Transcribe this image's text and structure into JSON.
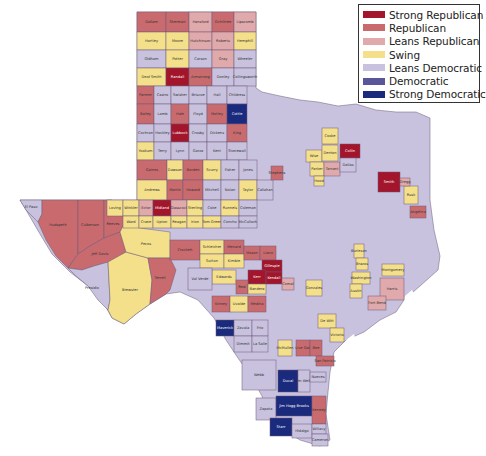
{
  "legend": {
    "items": [
      {
        "label": "Strong Republican",
        "color": "#a3152b"
      },
      {
        "label": "Republican",
        "color": "#c96b6e"
      },
      {
        "label": "Leans Republican",
        "color": "#e0a9ab"
      },
      {
        "label": "Swing",
        "color": "#f4e08a"
      },
      {
        "label": "Leans Democratic",
        "color": "#c8c2de"
      },
      {
        "label": "Democratic",
        "color": "#5a569a"
      },
      {
        "label": "Strong Democratic",
        "color": "#1a2a7c"
      }
    ]
  },
  "colors": {
    "SR": "#a3152b",
    "R": "#c96b6e",
    "LR": "#e0a9ab",
    "S": "#f4e08a",
    "LD": "#c8c2de",
    "D": "#5a569a",
    "SD": "#1a2a7c",
    "base": "#c8c2de"
  },
  "counties": [
    {
      "name": "Dallam",
      "c": "R",
      "x": 137,
      "y": 12,
      "w": 29,
      "h": 20
    },
    {
      "name": "Sherman",
      "c": "R",
      "x": 166,
      "y": 12,
      "w": 23,
      "h": 20
    },
    {
      "name": "Hansford",
      "c": "LR",
      "x": 189,
      "y": 12,
      "w": 23,
      "h": 20
    },
    {
      "name": "Ochiltree",
      "c": "R",
      "x": 212,
      "y": 12,
      "w": 22,
      "h": 20
    },
    {
      "name": "Lipscomb",
      "c": "LR",
      "x": 234,
      "y": 12,
      "w": 22,
      "h": 20
    },
    {
      "name": "Hartley",
      "c": "S",
      "x": 137,
      "y": 32,
      "w": 29,
      "h": 18
    },
    {
      "name": "Moore",
      "c": "S",
      "x": 166,
      "y": 32,
      "w": 23,
      "h": 18
    },
    {
      "name": "Hutchinson",
      "c": "LR",
      "x": 189,
      "y": 32,
      "w": 23,
      "h": 18
    },
    {
      "name": "Roberts",
      "c": "LR",
      "x": 212,
      "y": 32,
      "w": 22,
      "h": 18
    },
    {
      "name": "Hemphill",
      "c": "S",
      "x": 234,
      "y": 32,
      "w": 22,
      "h": 18
    },
    {
      "name": "Oldham",
      "c": "LD",
      "x": 137,
      "y": 50,
      "w": 29,
      "h": 18
    },
    {
      "name": "Potter",
      "c": "S",
      "x": 166,
      "y": 50,
      "w": 23,
      "h": 18
    },
    {
      "name": "Carson",
      "c": "LD",
      "x": 189,
      "y": 50,
      "w": 23,
      "h": 18
    },
    {
      "name": "Gray",
      "c": "LR",
      "x": 212,
      "y": 50,
      "w": 22,
      "h": 18
    },
    {
      "name": "Wheeler",
      "c": "LD",
      "x": 234,
      "y": 50,
      "w": 22,
      "h": 18
    },
    {
      "name": "Deaf Smith",
      "c": "S",
      "x": 137,
      "y": 68,
      "w": 29,
      "h": 18
    },
    {
      "name": "Randall",
      "c": "SR",
      "x": 166,
      "y": 68,
      "w": 23,
      "h": 18
    },
    {
      "name": "Armstrong",
      "c": "R",
      "x": 189,
      "y": 68,
      "w": 23,
      "h": 18
    },
    {
      "name": "Donley",
      "c": "LD",
      "x": 212,
      "y": 68,
      "w": 22,
      "h": 18
    },
    {
      "name": "Collingsworth",
      "c": "LD",
      "x": 234,
      "y": 68,
      "w": 22,
      "h": 18
    },
    {
      "name": "Parmer",
      "c": "R",
      "x": 137,
      "y": 86,
      "w": 17,
      "h": 18
    },
    {
      "name": "Castro",
      "c": "LD",
      "x": 154,
      "y": 86,
      "w": 17,
      "h": 18
    },
    {
      "name": "Swisher",
      "c": "LD",
      "x": 171,
      "y": 86,
      "w": 18,
      "h": 18
    },
    {
      "name": "Briscoe",
      "c": "LD",
      "x": 189,
      "y": 86,
      "w": 18,
      "h": 18
    },
    {
      "name": "Hall",
      "c": "LD",
      "x": 207,
      "y": 86,
      "w": 20,
      "h": 18
    },
    {
      "name": "Childress",
      "c": "LD",
      "x": 227,
      "y": 86,
      "w": 20,
      "h": 18
    },
    {
      "name": "Bailey",
      "c": "R",
      "x": 137,
      "y": 104,
      "w": 17,
      "h": 20
    },
    {
      "name": "Lamb",
      "c": "LD",
      "x": 154,
      "y": 104,
      "w": 17,
      "h": 20
    },
    {
      "name": "Hale",
      "c": "R",
      "x": 171,
      "y": 104,
      "w": 18,
      "h": 20
    },
    {
      "name": "Floyd",
      "c": "LD",
      "x": 189,
      "y": 104,
      "w": 18,
      "h": 20
    },
    {
      "name": "Motley",
      "c": "R",
      "x": 207,
      "y": 104,
      "w": 20,
      "h": 20
    },
    {
      "name": "Cottle",
      "c": "SD",
      "x": 227,
      "y": 104,
      "w": 20,
      "h": 20
    },
    {
      "name": "Cochran",
      "c": "LD",
      "x": 137,
      "y": 124,
      "w": 17,
      "h": 18
    },
    {
      "name": "Hockley",
      "c": "LD",
      "x": 154,
      "y": 124,
      "w": 17,
      "h": 18
    },
    {
      "name": "Lubbock",
      "c": "SR",
      "x": 171,
      "y": 124,
      "w": 18,
      "h": 18
    },
    {
      "name": "Crosby",
      "c": "LD",
      "x": 189,
      "y": 124,
      "w": 18,
      "h": 18
    },
    {
      "name": "Dickens",
      "c": "LD",
      "x": 207,
      "y": 124,
      "w": 20,
      "h": 18
    },
    {
      "name": "King",
      "c": "R",
      "x": 227,
      "y": 124,
      "w": 20,
      "h": 18
    },
    {
      "name": "Yoakum",
      "c": "S",
      "x": 137,
      "y": 142,
      "w": 17,
      "h": 18
    },
    {
      "name": "Terry",
      "c": "LD",
      "x": 154,
      "y": 142,
      "w": 17,
      "h": 18
    },
    {
      "name": "Lynn",
      "c": "LD",
      "x": 171,
      "y": 142,
      "w": 18,
      "h": 18
    },
    {
      "name": "Garza",
      "c": "LD",
      "x": 189,
      "y": 142,
      "w": 18,
      "h": 18
    },
    {
      "name": "Kent",
      "c": "LD",
      "x": 207,
      "y": 142,
      "w": 20,
      "h": 18
    },
    {
      "name": "Stonewall",
      "c": "LD",
      "x": 227,
      "y": 142,
      "w": 20,
      "h": 18
    },
    {
      "name": "Gaines",
      "c": "R",
      "x": 137,
      "y": 160,
      "w": 30,
      "h": 20
    },
    {
      "name": "Dawson",
      "c": "S",
      "x": 167,
      "y": 160,
      "w": 16,
      "h": 20
    },
    {
      "name": "Borden",
      "c": "R",
      "x": 183,
      "y": 160,
      "w": 20,
      "h": 20
    },
    {
      "name": "Scurry",
      "c": "S",
      "x": 203,
      "y": 160,
      "w": 18,
      "h": 20
    },
    {
      "name": "Fisher",
      "c": "LD",
      "x": 221,
      "y": 160,
      "w": 18,
      "h": 20
    },
    {
      "name": "Jones",
      "c": "LD",
      "x": 239,
      "y": 160,
      "w": 18,
      "h": 20
    },
    {
      "name": "Andrews",
      "c": "S",
      "x": 137,
      "y": 180,
      "w": 30,
      "h": 20
    },
    {
      "name": "Martin",
      "c": "R",
      "x": 167,
      "y": 180,
      "w": 16,
      "h": 20
    },
    {
      "name": "Howard",
      "c": "R",
      "x": 183,
      "y": 180,
      "w": 20,
      "h": 20
    },
    {
      "name": "Mitchell",
      "c": "LD",
      "x": 203,
      "y": 180,
      "w": 18,
      "h": 20
    },
    {
      "name": "Nolan",
      "c": "LD",
      "x": 221,
      "y": 180,
      "w": 18,
      "h": 20
    },
    {
      "name": "Taylor",
      "c": "S",
      "x": 239,
      "y": 180,
      "w": 18,
      "h": 20
    },
    {
      "name": "Callahan",
      "c": "LD",
      "x": 257,
      "y": 180,
      "w": 16,
      "h": 20
    },
    {
      "name": "Loving",
      "c": "S",
      "x": 107,
      "y": 200,
      "w": 16,
      "h": 16
    },
    {
      "name": "Winkler",
      "c": "S",
      "x": 123,
      "y": 200,
      "w": 16,
      "h": 16
    },
    {
      "name": "Ector",
      "c": "LR",
      "x": 139,
      "y": 200,
      "w": 14,
      "h": 16
    },
    {
      "name": "Midland",
      "c": "SR",
      "x": 153,
      "y": 200,
      "w": 18,
      "h": 16
    },
    {
      "name": "Glasscock",
      "c": "LR",
      "x": 171,
      "y": 200,
      "w": 16,
      "h": 16
    },
    {
      "name": "Sterling",
      "c": "S",
      "x": 187,
      "y": 200,
      "w": 16,
      "h": 16
    },
    {
      "name": "Coke",
      "c": "LD",
      "x": 203,
      "y": 200,
      "w": 18,
      "h": 16
    },
    {
      "name": "Runnels",
      "c": "S",
      "x": 221,
      "y": 200,
      "w": 18,
      "h": 16
    },
    {
      "name": "Coleman",
      "c": "LD",
      "x": 239,
      "y": 200,
      "w": 18,
      "h": 16
    },
    {
      "name": "Ward",
      "c": "S",
      "x": 123,
      "y": 216,
      "w": 16,
      "h": 12
    },
    {
      "name": "Crane",
      "c": "S",
      "x": 139,
      "y": 216,
      "w": 14,
      "h": 12
    },
    {
      "name": "Upton",
      "c": "S",
      "x": 153,
      "y": 216,
      "w": 18,
      "h": 12
    },
    {
      "name": "Reagan",
      "c": "S",
      "x": 171,
      "y": 216,
      "w": 16,
      "h": 12
    },
    {
      "name": "Irion",
      "c": "S",
      "x": 187,
      "y": 216,
      "w": 16,
      "h": 12
    },
    {
      "name": "Tom Green",
      "c": "S",
      "x": 203,
      "y": 216,
      "w": 18,
      "h": 12
    },
    {
      "name": "Concho",
      "c": "LD",
      "x": 221,
      "y": 216,
      "w": 18,
      "h": 12
    },
    {
      "name": "McCulloch",
      "c": "LD",
      "x": 239,
      "y": 216,
      "w": 18,
      "h": 12
    },
    {
      "name": "Crockett",
      "c": "R",
      "x": 170,
      "y": 240,
      "w": 30,
      "h": 20
    },
    {
      "name": "Schleicher",
      "c": "S",
      "x": 200,
      "y": 240,
      "w": 24,
      "h": 14
    },
    {
      "name": "Menard",
      "c": "R",
      "x": 224,
      "y": 240,
      "w": 20,
      "h": 14
    },
    {
      "name": "Sutton",
      "c": "S",
      "x": 200,
      "y": 254,
      "w": 24,
      "h": 14
    },
    {
      "name": "Kimble",
      "c": "S",
      "x": 224,
      "y": 254,
      "w": 20,
      "h": 14
    },
    {
      "name": "Mason",
      "c": "R",
      "x": 244,
      "y": 246,
      "w": 16,
      "h": 14
    },
    {
      "name": "Llano",
      "c": "R",
      "x": 260,
      "y": 246,
      "w": 16,
      "h": 14
    },
    {
      "name": "Gillespie",
      "c": "SR",
      "x": 262,
      "y": 260,
      "w": 20,
      "h": 12
    },
    {
      "name": "Kerr",
      "c": "SR",
      "x": 248,
      "y": 270,
      "w": 18,
      "h": 14
    },
    {
      "name": "Kendall",
      "c": "SR",
      "x": 266,
      "y": 272,
      "w": 16,
      "h": 12
    },
    {
      "name": "Edwards",
      "c": "S",
      "x": 212,
      "y": 270,
      "w": 24,
      "h": 14
    },
    {
      "name": "Real",
      "c": "R",
      "x": 236,
      "y": 280,
      "w": 12,
      "h": 14
    },
    {
      "name": "Bandera",
      "c": "S",
      "x": 248,
      "y": 284,
      "w": 18,
      "h": 10
    },
    {
      "name": "Val Verde",
      "c": "LD",
      "x": 188,
      "y": 268,
      "w": 24,
      "h": 22
    },
    {
      "name": "Kinney",
      "c": "R",
      "x": 212,
      "y": 296,
      "w": 18,
      "h": 16
    },
    {
      "name": "Uvalde",
      "c": "S",
      "x": 230,
      "y": 296,
      "w": 18,
      "h": 16
    },
    {
      "name": "Medina",
      "c": "R",
      "x": 248,
      "y": 296,
      "w": 18,
      "h": 16
    },
    {
      "name": "Maverick",
      "c": "SD",
      "x": 216,
      "y": 320,
      "w": 18,
      "h": 16
    },
    {
      "name": "Zavala",
      "c": "LD",
      "x": 234,
      "y": 320,
      "w": 18,
      "h": 16
    },
    {
      "name": "Frio",
      "c": "LD",
      "x": 252,
      "y": 320,
      "w": 16,
      "h": 16
    },
    {
      "name": "Dimmit",
      "c": "LD",
      "x": 234,
      "y": 336,
      "w": 18,
      "h": 16
    },
    {
      "name": "La Salle",
      "c": "LD",
      "x": 252,
      "y": 336,
      "w": 16,
      "h": 16
    },
    {
      "name": "McMullen",
      "c": "S",
      "x": 278,
      "y": 340,
      "w": 14,
      "h": 16
    },
    {
      "name": "Live Oak",
      "c": "R",
      "x": 296,
      "y": 340,
      "w": 14,
      "h": 16
    },
    {
      "name": "Bee",
      "c": "R",
      "x": 310,
      "y": 340,
      "w": 12,
      "h": 16
    },
    {
      "name": "San Patricio",
      "c": "R",
      "x": 316,
      "y": 356,
      "w": 18,
      "h": 10
    },
    {
      "name": "Webb",
      "c": "LD",
      "x": 242,
      "y": 360,
      "w": 34,
      "h": 30
    },
    {
      "name": "Duval",
      "c": "SD",
      "x": 278,
      "y": 370,
      "w": 20,
      "h": 22
    },
    {
      "name": "Jim Wells",
      "c": "LD",
      "x": 298,
      "y": 370,
      "w": 12,
      "h": 22
    },
    {
      "name": "Nueces",
      "c": "LD",
      "x": 310,
      "y": 372,
      "w": 16,
      "h": 10
    },
    {
      "name": "Zapata",
      "c": "LD",
      "x": 256,
      "y": 398,
      "w": 20,
      "h": 22
    },
    {
      "name": "Jim Hogg Brooks",
      "c": "SD",
      "x": 276,
      "y": 396,
      "w": 36,
      "h": 20
    },
    {
      "name": "Kenedy",
      "c": "R",
      "x": 312,
      "y": 396,
      "w": 14,
      "h": 28
    },
    {
      "name": "Starr",
      "c": "SD",
      "x": 270,
      "y": 418,
      "w": 22,
      "h": 18
    },
    {
      "name": "Hidalgo",
      "c": "LD",
      "x": 292,
      "y": 424,
      "w": 20,
      "h": 14
    },
    {
      "name": "Willacy",
      "c": "LD",
      "x": 312,
      "y": 424,
      "w": 14,
      "h": 10
    },
    {
      "name": "Cameron",
      "c": "LD",
      "x": 312,
      "y": 434,
      "w": 16,
      "h": 12
    },
    {
      "name": "Gonzales",
      "c": "S",
      "x": 306,
      "y": 280,
      "w": 16,
      "h": 16
    },
    {
      "name": "Comal",
      "c": "LR",
      "x": 282,
      "y": 278,
      "w": 12,
      "h": 12
    },
    {
      "name": "De Witt",
      "c": "S",
      "x": 318,
      "y": 314,
      "w": 18,
      "h": 14
    },
    {
      "name": "Victoria",
      "c": "S",
      "x": 330,
      "y": 328,
      "w": 14,
      "h": 14
    },
    {
      "name": "Burleson",
      "c": "S",
      "x": 354,
      "y": 244,
      "w": 10,
      "h": 14
    },
    {
      "name": "Washington",
      "c": "S",
      "x": 352,
      "y": 272,
      "w": 18,
      "h": 12
    },
    {
      "name": "Austin",
      "c": "S",
      "x": 350,
      "y": 284,
      "w": 12,
      "h": 14
    },
    {
      "name": "Montgomery",
      "c": "S",
      "x": 382,
      "y": 264,
      "w": 22,
      "h": 12
    },
    {
      "name": "Harris",
      "c": "LR",
      "x": 380,
      "y": 278,
      "w": 24,
      "h": 22
    },
    {
      "name": "Fort Bend",
      "c": "LR",
      "x": 368,
      "y": 296,
      "w": 18,
      "h": 14
    },
    {
      "name": "Stephens",
      "c": "R",
      "x": 271,
      "y": 166,
      "w": 12,
      "h": 14
    },
    {
      "name": "Wise",
      "c": "S",
      "x": 306,
      "y": 150,
      "w": 16,
      "h": 12
    },
    {
      "name": "Denton",
      "c": "S",
      "x": 322,
      "y": 145,
      "w": 16,
      "h": 16
    },
    {
      "name": "Cooke",
      "c": "S",
      "x": 322,
      "y": 128,
      "w": 16,
      "h": 16
    },
    {
      "name": "Collin",
      "c": "SR",
      "x": 340,
      "y": 144,
      "w": 20,
      "h": 14
    },
    {
      "name": "Parker",
      "c": "S",
      "x": 310,
      "y": 162,
      "w": 14,
      "h": 14
    },
    {
      "name": "Tarrant",
      "c": "LR",
      "x": 324,
      "y": 162,
      "w": 16,
      "h": 14
    },
    {
      "name": "Rockwall",
      "c": "S",
      "x": 344,
      "y": 160,
      "w": 8,
      "h": 8
    },
    {
      "name": "Dallas",
      "c": "LD",
      "x": 340,
      "y": 158,
      "w": 16,
      "h": 14
    },
    {
      "name": "Smith",
      "c": "SR",
      "x": 378,
      "y": 172,
      "w": 22,
      "h": 20
    },
    {
      "name": "Rusk",
      "c": "S",
      "x": 404,
      "y": 186,
      "w": 14,
      "h": 18
    },
    {
      "name": "Gregg",
      "c": "LR",
      "x": 400,
      "y": 178,
      "w": 10,
      "h": 8
    },
    {
      "name": "Angelina",
      "c": "R",
      "x": 410,
      "y": 206,
      "w": 16,
      "h": 12
    },
    {
      "name": "Hood",
      "c": "S",
      "x": 314,
      "y": 176,
      "w": 10,
      "h": 10
    },
    {
      "name": "Brazos",
      "c": "S",
      "x": 356,
      "y": 258,
      "w": 12,
      "h": 12
    }
  ],
  "labels": {
    "El Paso": "El Paso",
    "Hudspeth": "Hudspeth",
    "Culberson": "Culberson",
    "Reeves": "Reeves",
    "Jeff Davis": "Jeff Davis",
    "Presidio": "Presidio",
    "Brewster": "Brewster",
    "Pecos": "Pecos",
    "Terrell": "Terrell"
  }
}
